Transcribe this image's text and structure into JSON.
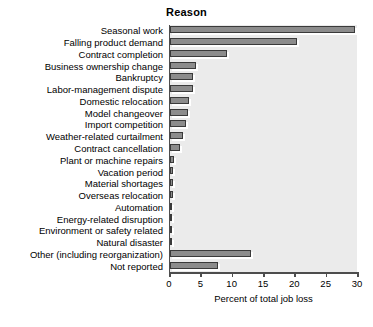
{
  "chart_data": {
    "type": "bar",
    "orientation": "horizontal",
    "title": "Reason",
    "xlabel": "Percent of total job loss",
    "ylabel": "",
    "xlim": [
      0,
      30
    ],
    "xticks": [
      0,
      5,
      10,
      15,
      20,
      25,
      30
    ],
    "grid": false,
    "legend": null,
    "bar_color": "#8c8c8c",
    "bar_edge_color": "#3a3a3a",
    "plot_background": "#ebebeb",
    "categories": [
      "Seasonal work",
      "Falling product demand",
      "Contract completion",
      "Business ownership change",
      "Bankruptcy",
      "Labor-management dispute",
      "Domestic relocation",
      "Model changeover",
      "Import competition",
      "Weather-related curtailment",
      "Contract cancellation",
      "Plant or machine repairs",
      "Vacation period",
      "Material shortages",
      "Overseas relocation",
      "Automation",
      "Energy-related disruption",
      "Environment or safety related",
      "Natural disaster",
      "Other (including reorganization)",
      "Not reported"
    ],
    "values": [
      29.6,
      20.2,
      9.1,
      4.2,
      3.7,
      3.6,
      3.1,
      2.8,
      2.6,
      2.1,
      1.6,
      0.6,
      0.5,
      0.5,
      0.4,
      0.3,
      0.3,
      0.3,
      0.3,
      12.9,
      7.7
    ]
  }
}
